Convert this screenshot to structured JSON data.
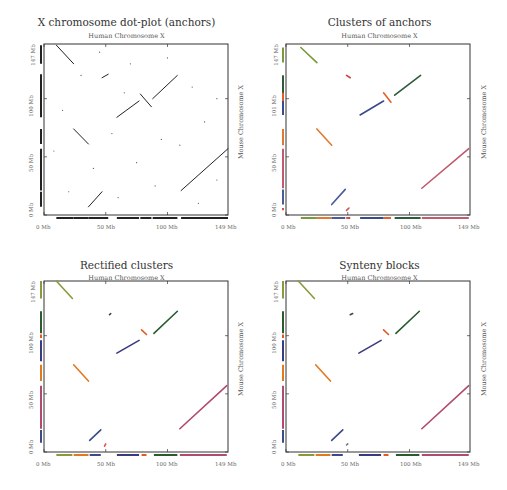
{
  "chart_data": [
    {
      "type": "scatter",
      "title": "X chromosome dot-plot (anchors)",
      "subtitle": "Human Chromosome X",
      "xlabel": "Human Chromosome X",
      "ylabel": "Mouse Chromosome X",
      "xlim": [
        0,
        149
      ],
      "ylim": [
        0,
        147
      ],
      "x_ticks": [
        "0 Mb",
        "50 Mb",
        "100 Mb",
        "149 Mb"
      ],
      "y_ticks": [
        "0 Mb",
        "50 Mb",
        "100 Mb",
        "147 Mb"
      ],
      "color_mode": "black",
      "segments": [
        {
          "x0": 10,
          "y0": 146,
          "x1": 24,
          "y1": 130,
          "color": "#222222"
        },
        {
          "x0": 47,
          "y0": 118,
          "x1": 52,
          "y1": 121,
          "color": "#222222"
        },
        {
          "x0": 88,
          "y0": 100,
          "x1": 108,
          "y1": 120,
          "color": "#222222"
        },
        {
          "x0": 78,
          "y0": 104,
          "x1": 87,
          "y1": 93,
          "color": "#222222"
        },
        {
          "x0": 59,
          "y0": 84,
          "x1": 77,
          "y1": 98,
          "color": "#222222"
        },
        {
          "x0": 24,
          "y0": 74,
          "x1": 36,
          "y1": 61,
          "color": "#222222"
        },
        {
          "x0": 111,
          "y0": 21,
          "x1": 149,
          "y1": 57,
          "color": "#222222"
        },
        {
          "x0": 36,
          "y0": 7,
          "x1": 47,
          "y1": 20,
          "color": "#222222"
        }
      ]
    },
    {
      "type": "scatter",
      "title": "Clusters of anchors",
      "subtitle": "Human Chromosome X",
      "xlabel": "Human Chromosome X",
      "ylabel": "Mouse Chromosome X",
      "xlim": [
        0,
        149
      ],
      "ylim": [
        0,
        147
      ],
      "x_ticks": [
        "0 Mb",
        "50 Mb",
        "100 Mb",
        "149 Mb"
      ],
      "y_ticks": [
        "0 Mb",
        "50 Mb",
        "101 Mb",
        "147 Mb"
      ],
      "segments": [
        {
          "x0": 12,
          "y0": 144,
          "x1": 25,
          "y1": 131,
          "color": "#7a9a3a"
        },
        {
          "x0": 49,
          "y0": 120,
          "x1": 52,
          "y1": 118,
          "color": "#d04040"
        },
        {
          "x0": 88,
          "y0": 103,
          "x1": 109,
          "y1": 120,
          "color": "#2f5a3a"
        },
        {
          "x0": 79,
          "y0": 105,
          "x1": 85,
          "y1": 97,
          "color": "#e0602a"
        },
        {
          "x0": 60,
          "y0": 86,
          "x1": 79,
          "y1": 98,
          "color": "#3a4a8a"
        },
        {
          "x0": 25,
          "y0": 74,
          "x1": 37,
          "y1": 60,
          "color": "#e07a30"
        },
        {
          "x0": 110,
          "y0": 23,
          "x1": 148,
          "y1": 57,
          "color": "#c05a70"
        },
        {
          "x0": 37,
          "y0": 9,
          "x1": 48,
          "y1": 22,
          "color": "#4a5a9a"
        },
        {
          "x0": 49,
          "y0": 4,
          "x1": 51,
          "y1": 6,
          "color": "#d05050"
        }
      ]
    },
    {
      "type": "scatter",
      "title": "Rectified clusters",
      "subtitle": "Human Chromosome X",
      "xlabel": "Human Chromosome X",
      "ylabel": "Mouse Chromosome X",
      "xlim": [
        0,
        149
      ],
      "ylim": [
        0,
        147
      ],
      "x_ticks": [
        "0 Mb",
        "50 Mb",
        "100 Mb",
        "149 Mb"
      ],
      "y_ticks": [
        "0 Mb",
        "50 Mb",
        "100 Mb",
        "147 Mb"
      ],
      "segments": [
        {
          "x0": 10,
          "y0": 147,
          "x1": 23,
          "y1": 132,
          "color": "#8a9a3a"
        },
        {
          "x0": 53,
          "y0": 118,
          "x1": 54,
          "y1": 119,
          "color": "#444444"
        },
        {
          "x0": 89,
          "y0": 102,
          "x1": 108,
          "y1": 121,
          "color": "#2a5a30"
        },
        {
          "x0": 79,
          "y0": 105,
          "x1": 83,
          "y1": 101,
          "color": "#e05a20"
        },
        {
          "x0": 59,
          "y0": 85,
          "x1": 77,
          "y1": 96,
          "color": "#3a3a80"
        },
        {
          "x0": 24,
          "y0": 75,
          "x1": 36,
          "y1": 61,
          "color": "#e07a20"
        },
        {
          "x0": 110,
          "y0": 20,
          "x1": 148,
          "y1": 57,
          "color": "#b04a70"
        },
        {
          "x0": 37,
          "y0": 10,
          "x1": 46,
          "y1": 19,
          "color": "#3a4a8a"
        },
        {
          "x0": 49,
          "y0": 5,
          "x1": 50,
          "y1": 7,
          "color": "#e05050"
        }
      ],
      "x_bar": [
        {
          "from": 10,
          "to": 23,
          "color": "#8a9a3a"
        },
        {
          "from": 24,
          "to": 36,
          "color": "#e07a20"
        },
        {
          "from": 37,
          "to": 46,
          "color": "#3a4a8a"
        },
        {
          "from": 59,
          "to": 77,
          "color": "#3a3a80"
        },
        {
          "from": 79,
          "to": 83,
          "color": "#e05a20"
        },
        {
          "from": 89,
          "to": 108,
          "color": "#2a5a30"
        },
        {
          "from": 110,
          "to": 148,
          "color": "#b04a70"
        }
      ],
      "y_bar": [
        {
          "from": 132,
          "to": 147,
          "color": "#8a9a3a"
        },
        {
          "from": 102,
          "to": 121,
          "color": "#2a5a30"
        },
        {
          "from": 98,
          "to": 101,
          "color": "#e05a20"
        },
        {
          "from": 78,
          "to": 96,
          "color": "#3a3a80"
        },
        {
          "from": 61,
          "to": 75,
          "color": "#e07a20"
        },
        {
          "from": 20,
          "to": 57,
          "color": "#b04a70"
        },
        {
          "from": 8,
          "to": 19,
          "color": "#3a4a8a"
        }
      ]
    },
    {
      "type": "scatter",
      "title": "Synteny blocks",
      "subtitle": "Human Chromosome X",
      "xlabel": "Human Chromosome X",
      "ylabel": "Mouse Chromosome X",
      "xlim": [
        0,
        149
      ],
      "ylim": [
        0,
        147
      ],
      "x_ticks": [
        "0 Mb",
        "50 Mb",
        "100 Mb",
        "149 Mb"
      ],
      "y_ticks": [
        "0 Mb",
        "50 Mb",
        "100 Mb",
        "147 Mb"
      ],
      "segments": [
        {
          "x0": 10,
          "y0": 147,
          "x1": 23,
          "y1": 132,
          "color": "#8a9a3a"
        },
        {
          "x0": 52,
          "y0": 118,
          "x1": 54,
          "y1": 119,
          "color": "#444444"
        },
        {
          "x0": 89,
          "y0": 102,
          "x1": 108,
          "y1": 121,
          "color": "#2a5a30"
        },
        {
          "x0": 79,
          "y0": 105,
          "x1": 83,
          "y1": 101,
          "color": "#e05a20"
        },
        {
          "x0": 59,
          "y0": 85,
          "x1": 77,
          "y1": 96,
          "color": "#3a3a80"
        },
        {
          "x0": 24,
          "y0": 75,
          "x1": 36,
          "y1": 61,
          "color": "#e07a20"
        },
        {
          "x0": 110,
          "y0": 20,
          "x1": 148,
          "y1": 57,
          "color": "#b04a70"
        },
        {
          "x0": 37,
          "y0": 10,
          "x1": 46,
          "y1": 19,
          "color": "#3a4a8a"
        },
        {
          "x0": 49,
          "y0": 6,
          "x1": 50,
          "y1": 7,
          "color": "#777777"
        }
      ],
      "x_bar": [
        {
          "from": 10,
          "to": 23,
          "color": "#8a9a3a"
        },
        {
          "from": 24,
          "to": 36,
          "color": "#e07a20"
        },
        {
          "from": 37,
          "to": 46,
          "color": "#3a4a8a"
        },
        {
          "from": 59,
          "to": 77,
          "color": "#3a3a80"
        },
        {
          "from": 79,
          "to": 83,
          "color": "#e05a20"
        },
        {
          "from": 89,
          "to": 108,
          "color": "#2a5a30"
        },
        {
          "from": 110,
          "to": 148,
          "color": "#b04a70"
        }
      ],
      "y_bar": [
        {
          "from": 132,
          "to": 147,
          "color": "#8a9a3a"
        },
        {
          "from": 102,
          "to": 121,
          "color": "#2a5a30"
        },
        {
          "from": 98,
          "to": 101,
          "color": "#e05a20"
        },
        {
          "from": 78,
          "to": 96,
          "color": "#3a3a80"
        },
        {
          "from": 61,
          "to": 75,
          "color": "#e07a20"
        },
        {
          "from": 20,
          "to": 57,
          "color": "#b04a70"
        },
        {
          "from": 8,
          "to": 19,
          "color": "#3a4a8a"
        }
      ]
    }
  ]
}
